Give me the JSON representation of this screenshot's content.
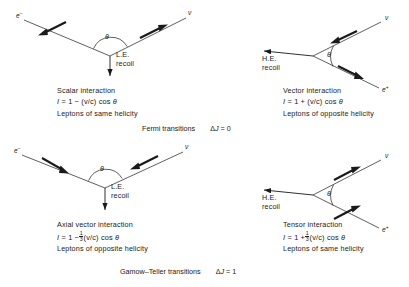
{
  "figure": {
    "panels": [
      {
        "id": "scalar",
        "position": "top-left",
        "recoil_label": "L.E.",
        "recoil_sub": "recoil",
        "angle_symbol": "θ",
        "left_particle": "e",
        "left_particle_charge": "−",
        "right_particle": "ν",
        "right_particle_charge": "",
        "interaction_name": "Scalar interaction",
        "intensity_label": "I",
        "formula_text": "I = 1 − (v/c) cos θ",
        "formula_sign": "−",
        "formula_coeff": "",
        "helicity_text": "Leptons of same helicity"
      },
      {
        "id": "vector",
        "position": "top-right",
        "recoil_label": "H.E.",
        "recoil_sub": "recoil",
        "angle_symbol": "θ",
        "left_particle": "ν",
        "left_particle_charge": "",
        "right_particle": "e",
        "right_particle_charge": "+",
        "interaction_name": "Vector interaction",
        "intensity_label": "I",
        "formula_text": "I = 1 + (v/c) cos θ",
        "formula_sign": "+",
        "formula_coeff": "",
        "helicity_text": "Leptons of opposite helicity"
      },
      {
        "id": "axial-vector",
        "position": "bottom-left",
        "recoil_label": "L.E.",
        "recoil_sub": "recoil",
        "angle_symbol": "θ",
        "left_particle": "e",
        "left_particle_charge": "−",
        "right_particle": "ν",
        "right_particle_charge": "",
        "interaction_name": "Axial vector interaction",
        "intensity_label": "I",
        "formula_text": "I = 1 − ⅓(v/c) cos θ",
        "formula_sign": "−",
        "formula_coeff_num": "1",
        "formula_coeff_den": "3",
        "helicity_text": "Leptons of opposite helicity"
      },
      {
        "id": "tensor",
        "position": "bottom-right",
        "recoil_label": "H.E.",
        "recoil_sub": "recoil",
        "angle_symbol": "θ",
        "left_particle": "ν",
        "left_particle_charge": "",
        "right_particle": "e",
        "right_particle_charge": "+",
        "interaction_name": "Tensor interaction",
        "intensity_label": "I",
        "formula_text": "I = 1 + ⅓(v/c) cos θ",
        "formula_sign": "+",
        "formula_coeff_num": "1",
        "formula_coeff_den": "3",
        "helicity_text": "Leptons of same helicity"
      }
    ],
    "captions": [
      {
        "id": "fermi",
        "name": "Fermi transitions",
        "selection_rule": "ΔJ = 0",
        "delta_symbol": "Δ",
        "j_symbol": "J",
        "rule_value": "0"
      },
      {
        "id": "gamow-teller",
        "name": "Gamow–Teller transitions",
        "selection_rule": "ΔJ = 1",
        "delta_symbol": "Δ",
        "j_symbol": "J",
        "rule_value": "1"
      }
    ],
    "formula_parts": {
      "eq": "=",
      "one": "1",
      "vc": "(v/c)",
      "cos": "cos"
    },
    "colors": {
      "ink": "#1a1a1a",
      "background": "#ffffff"
    }
  }
}
